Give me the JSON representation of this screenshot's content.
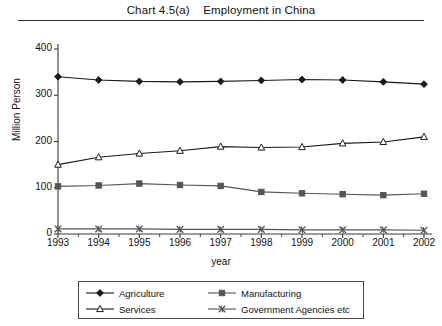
{
  "chart_data": {
    "type": "line",
    "title": "Chart 4.5(a)    Employment in China",
    "title_number": "Chart 4.5(a)",
    "title_text": "Employment in China",
    "xlabel": "year",
    "ylabel": "Million Person",
    "categories": [
      1993,
      1994,
      1995,
      1996,
      1997,
      1998,
      1999,
      2000,
      2001,
      2002
    ],
    "xtick_labels": [
      "1993",
      "1994",
      "1995",
      "1996",
      "1997",
      "1998",
      "1999",
      "2000",
      "2001",
      "2002"
    ],
    "ytick_labels": [
      "0",
      "100",
      "200",
      "300",
      "400"
    ],
    "ytick_values": [
      0,
      100,
      200,
      300,
      400
    ],
    "ylim": [
      0,
      400
    ],
    "xlim": [
      1993,
      2002
    ],
    "grid": false,
    "legend_position": "bottom-center",
    "series": [
      {
        "name": "Agriculture",
        "marker": "filled-diamond",
        "color": "#1a1a1a",
        "values": [
          340,
          333,
          330,
          329,
          330,
          332,
          334,
          333,
          329,
          324
        ]
      },
      {
        "name": "Manufacturing",
        "marker": "filled-square",
        "color": "#555555",
        "values": [
          103,
          105,
          109,
          106,
          104,
          91,
          88,
          86,
          84,
          87
        ]
      },
      {
        "name": "Services",
        "marker": "open-triangle",
        "color": "#1a1a1a",
        "values": [
          150,
          166,
          174,
          180,
          189,
          187,
          188,
          196,
          199,
          210
        ]
      },
      {
        "name": "Government Agencies etc",
        "marker": "x-cross",
        "color": "#555555",
        "values": [
          11,
          11,
          11,
          10,
          10,
          10,
          9,
          9,
          9,
          8
        ]
      }
    ]
  },
  "legend": {
    "items": [
      {
        "label": "Agriculture"
      },
      {
        "label": "Manufacturing"
      },
      {
        "label": "Services"
      },
      {
        "label": "Government Agencies etc"
      }
    ]
  }
}
